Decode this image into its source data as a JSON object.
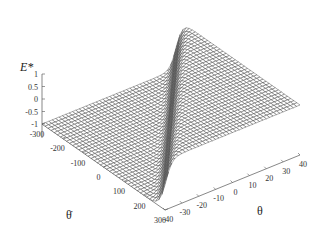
{
  "chart_data": {
    "type": "surface3d",
    "title": "",
    "zlabel": "E*",
    "xlabel": "θ̇",
    "ylabel": "θ",
    "x_ticks": [
      -300,
      -200,
      -100,
      0,
      100,
      200,
      300
    ],
    "y_ticks": [
      -40,
      -30,
      -20,
      -10,
      0,
      10,
      20,
      30,
      40
    ],
    "z_ticks": [
      1,
      0.5,
      0,
      -0.5,
      -1
    ],
    "x_tick_labels": [
      "-300",
      "-200",
      "-100",
      "0",
      "100",
      "200",
      "300"
    ],
    "y_tick_labels": [
      "-40",
      "-30",
      "-20",
      "-10",
      "0",
      "10",
      "20",
      "30",
      "40"
    ],
    "z_tick_labels": [
      "1",
      "0.5",
      "0",
      "-0.5",
      "-1"
    ],
    "xlim": [
      -300,
      300
    ],
    "ylim": [
      -40,
      40
    ],
    "zlim": [
      -1,
      1
    ],
    "surface": {
      "description": "E* ≈ +1 on one side of the switching line θ + θ̇/7.5 = 0 and ≈ -1 on the other, with a smooth transition near the line",
      "high_value": 1,
      "low_value": -1,
      "switching_slope": -0.1333,
      "grid_x_count": 40,
      "grid_y_count": 40
    },
    "grid": false,
    "legend": "none"
  }
}
